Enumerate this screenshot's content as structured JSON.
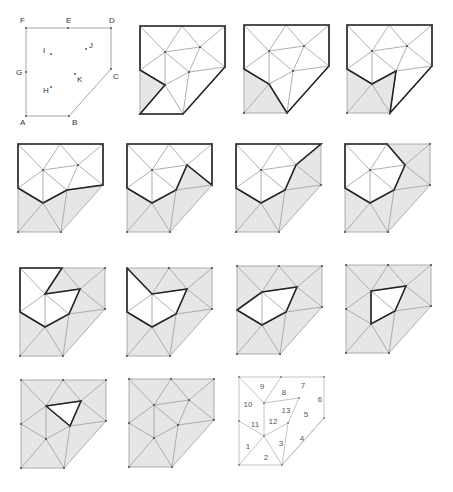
{
  "figure": {
    "colors": {
      "background": "#ffffff",
      "shade": "#e6e6e6",
      "thin_line": "#9a9a9a",
      "bold_line": "#222222",
      "label": "#333333",
      "vertex": "#444444"
    },
    "vertices": {
      "F": [
        0,
        0
      ],
      "E": [
        42,
        0
      ],
      "D": [
        85,
        0
      ],
      "C": [
        85,
        41
      ],
      "B": [
        43,
        88
      ],
      "A": [
        0,
        88
      ],
      "G": [
        0,
        44
      ],
      "I": [
        25,
        26
      ],
      "J": [
        60,
        21
      ],
      "K": [
        49,
        46
      ],
      "H": [
        25,
        59
      ]
    },
    "vertex_labels": [
      {
        "name": "F",
        "dx": -6,
        "dy": -5
      },
      {
        "name": "E",
        "dx": -2,
        "dy": -5
      },
      {
        "name": "D",
        "dx": -2,
        "dy": -5
      },
      {
        "name": "C",
        "dx": 2,
        "dy": 10
      },
      {
        "name": "B",
        "dx": 3,
        "dy": 9
      },
      {
        "name": "A",
        "dx": -6,
        "dy": 9
      },
      {
        "name": "G",
        "dx": -10,
        "dy": 3
      },
      {
        "name": "I",
        "dx": -8,
        "dy": -1
      },
      {
        "name": "J",
        "dx": 3,
        "dy": -1
      },
      {
        "name": "K",
        "dx": 2,
        "dy": 8
      },
      {
        "name": "H",
        "dx": -8,
        "dy": 6
      }
    ],
    "outline": [
      "A",
      "B",
      "C",
      "D",
      "E",
      "F",
      "G"
    ],
    "edges": [
      [
        "F",
        "E"
      ],
      [
        "E",
        "D"
      ],
      [
        "D",
        "C"
      ],
      [
        "C",
        "B"
      ],
      [
        "B",
        "A"
      ],
      [
        "A",
        "G"
      ],
      [
        "G",
        "F"
      ],
      [
        "F",
        "I"
      ],
      [
        "I",
        "E"
      ],
      [
        "E",
        "J"
      ],
      [
        "J",
        "D"
      ],
      [
        "J",
        "C"
      ],
      [
        "I",
        "J"
      ],
      [
        "I",
        "K"
      ],
      [
        "J",
        "K"
      ],
      [
        "K",
        "C"
      ],
      [
        "K",
        "B"
      ],
      [
        "K",
        "H"
      ],
      [
        "I",
        "H"
      ],
      [
        "I",
        "G"
      ],
      [
        "G",
        "H"
      ],
      [
        "H",
        "A"
      ],
      [
        "H",
        "B"
      ]
    ],
    "triangles": [
      {
        "id": 1,
        "v": [
          "A",
          "G",
          "H"
        ],
        "label_pos": [
          9,
          72
        ]
      },
      {
        "id": 2,
        "v": [
          "A",
          "H",
          "B"
        ],
        "label_pos": [
          27,
          83
        ]
      },
      {
        "id": 3,
        "v": [
          "H",
          "K",
          "B"
        ],
        "label_pos": [
          42,
          69
        ]
      },
      {
        "id": 4,
        "v": [
          "K",
          "C",
          "B"
        ],
        "label_pos": [
          63,
          64
        ]
      },
      {
        "id": 5,
        "v": [
          "K",
          "J",
          "C"
        ],
        "label_pos": [
          67,
          40
        ]
      },
      {
        "id": 6,
        "v": [
          "J",
          "D",
          "C"
        ],
        "label_pos": [
          81,
          25
        ]
      },
      {
        "id": 7,
        "v": [
          "E",
          "D",
          "J"
        ],
        "label_pos": [
          64,
          11
        ]
      },
      {
        "id": 8,
        "v": [
          "I",
          "E",
          "J"
        ],
        "label_pos": [
          45,
          18
        ]
      },
      {
        "id": 9,
        "v": [
          "F",
          "E",
          "I"
        ],
        "label_pos": [
          23,
          12
        ]
      },
      {
        "id": 10,
        "v": [
          "F",
          "I",
          "G"
        ],
        "label_pos": [
          9,
          30
        ]
      },
      {
        "id": 11,
        "v": [
          "G",
          "I",
          "H"
        ],
        "label_pos": [
          16,
          50
        ]
      },
      {
        "id": 12,
        "v": [
          "I",
          "K",
          "H"
        ],
        "label_pos": [
          34,
          47
        ]
      },
      {
        "id": 13,
        "v": [
          "I",
          "J",
          "K"
        ],
        "label_pos": [
          47,
          36
        ]
      }
    ],
    "numbered_panel_edges": [
      [
        "F",
        "E"
      ],
      [
        "E",
        "D"
      ],
      [
        "D",
        "C"
      ],
      [
        "C",
        "B"
      ],
      [
        "B",
        "A"
      ],
      [
        "A",
        "G"
      ],
      [
        "G",
        "F"
      ],
      [
        "F",
        "I"
      ],
      [
        "I",
        "E"
      ],
      [
        "I",
        "J"
      ],
      [
        "I",
        "H"
      ],
      [
        "H",
        "K"
      ],
      [
        "K",
        "B"
      ],
      [
        "C",
        "B"
      ],
      [
        "H",
        "A"
      ],
      [
        "H",
        "B"
      ],
      [
        "G",
        "H"
      ],
      [
        "K",
        "J"
      ]
    ],
    "panels": [
      {
        "id": 1,
        "type": "labeled",
        "origin": [
          26,
          28
        ]
      },
      {
        "id": 2,
        "type": "step",
        "origin": [
          140,
          26
        ],
        "shaded": [
          1
        ],
        "bold": [
          "F",
          "D",
          "C",
          "B",
          "A",
          "H",
          "G",
          "F"
        ]
      },
      {
        "id": 3,
        "type": "step",
        "origin": [
          244,
          25
        ],
        "shaded": [
          1,
          2
        ],
        "bold": [
          "F",
          "D",
          "C",
          "B",
          "H",
          "G",
          "F"
        ]
      },
      {
        "id": 4,
        "type": "step",
        "origin": [
          347,
          25
        ],
        "shaded": [
          1,
          2,
          3
        ],
        "bold": [
          "F",
          "D",
          "C",
          "B",
          "K",
          "H",
          "G",
          "F"
        ]
      },
      {
        "id": 5,
        "type": "step",
        "origin": [
          18,
          144
        ],
        "shaded": [
          1,
          2,
          3,
          4
        ],
        "bold": [
          "F",
          "D",
          "C",
          "K",
          "H",
          "G",
          "F"
        ]
      },
      {
        "id": 6,
        "type": "step",
        "origin": [
          127,
          144
        ],
        "shaded": [
          1,
          2,
          3,
          4,
          5
        ],
        "bold": [
          "F",
          "D",
          "C",
          "J",
          "K",
          "H",
          "G",
          "F"
        ]
      },
      {
        "id": 7,
        "type": "step",
        "origin": [
          236,
          144
        ],
        "shaded": [
          1,
          2,
          3,
          4,
          5,
          6
        ],
        "bold": [
          "F",
          "D",
          "J",
          "K",
          "H",
          "G",
          "F"
        ]
      },
      {
        "id": 8,
        "type": "step",
        "origin": [
          345,
          144
        ],
        "shaded": [
          1,
          2,
          3,
          4,
          5,
          6,
          7
        ],
        "bold": [
          "F",
          "E",
          "J",
          "K",
          "H",
          "G",
          "F"
        ]
      },
      {
        "id": 9,
        "type": "step",
        "origin": [
          20,
          268
        ],
        "shaded": [
          1,
          2,
          3,
          4,
          5,
          6,
          7,
          8
        ],
        "bold": [
          "F",
          "E",
          "I",
          "J",
          "K",
          "H",
          "G",
          "F"
        ]
      },
      {
        "id": 10,
        "type": "step",
        "origin": [
          127,
          268
        ],
        "shaded": [
          1,
          2,
          3,
          4,
          5,
          6,
          7,
          8,
          9
        ],
        "bold": [
          "F",
          "I",
          "J",
          "K",
          "H",
          "G",
          "F"
        ]
      },
      {
        "id": 11,
        "type": "step",
        "origin": [
          237,
          266
        ],
        "shaded": [
          1,
          2,
          3,
          4,
          5,
          6,
          7,
          8,
          9,
          10
        ],
        "bold": [
          "G",
          "I",
          "J",
          "K",
          "H",
          "G"
        ]
      },
      {
        "id": 12,
        "type": "step",
        "origin": [
          346,
          265
        ],
        "shaded": [
          1,
          2,
          3,
          4,
          5,
          6,
          7,
          8,
          9,
          10,
          11
        ],
        "bold": [
          "I",
          "J",
          "K",
          "H",
          "I"
        ]
      },
      {
        "id": 13,
        "type": "step",
        "origin": [
          21,
          380
        ],
        "shaded": [
          1,
          2,
          3,
          4,
          5,
          6,
          7,
          8,
          9,
          10,
          11,
          12
        ],
        "bold": [
          "I",
          "J",
          "K",
          "I"
        ]
      },
      {
        "id": 14,
        "type": "step",
        "origin": [
          129,
          379
        ],
        "shaded": [
          1,
          2,
          3,
          4,
          5,
          6,
          7,
          8,
          9,
          10,
          11,
          12,
          13
        ],
        "bold": []
      },
      {
        "id": 15,
        "type": "numbered",
        "origin": [
          239,
          377
        ]
      }
    ]
  }
}
